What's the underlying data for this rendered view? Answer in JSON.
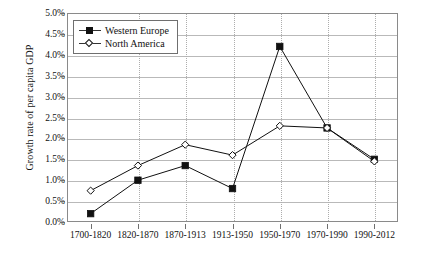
{
  "chart_data": {
    "type": "line",
    "title": "",
    "xlabel": "",
    "ylabel": "Growth rate of per capita GDP",
    "categories": [
      "1700-1820",
      "1820-1870",
      "1870-1913",
      "1913-1950",
      "1950-1970",
      "1970-1990",
      "1990-2012"
    ],
    "ylim": [
      0.0,
      5.0
    ],
    "ytick_values": [
      0.0,
      0.5,
      1.0,
      1.5,
      2.0,
      2.5,
      3.0,
      3.5,
      4.0,
      4.5,
      5.0
    ],
    "ytick_labels": [
      "0.0%",
      "0.5%",
      "1.0%",
      "1.5%",
      "2.0%",
      "2.5%",
      "3.0%",
      "3.5%",
      "4.0%",
      "4.5%",
      "5.0%"
    ],
    "grid": true,
    "legend_position": "top-left",
    "series": [
      {
        "name": "Western Europe",
        "marker": "filled-square",
        "color": "#111111",
        "values": [
          0.2,
          1.0,
          1.35,
          0.8,
          4.2,
          2.25,
          1.5
        ]
      },
      {
        "name": "North America",
        "marker": "open-diamond",
        "color": "#111111",
        "values": [
          0.75,
          1.35,
          1.85,
          1.6,
          2.3,
          2.25,
          1.45
        ]
      }
    ]
  }
}
